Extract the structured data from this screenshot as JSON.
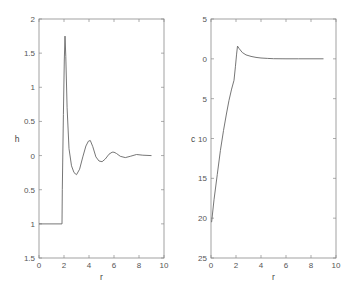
{
  "chart_data": [
    {
      "type": "line",
      "title": "",
      "xlabel": "r",
      "ylabel": "h",
      "xlim": [
        0,
        10
      ],
      "ylim": [
        -1.5,
        2
      ],
      "grid": false,
      "x_ticks": [
        0,
        2,
        4,
        6,
        8,
        10
      ],
      "x_tick_labels": [
        "0",
        "2",
        "4",
        "6",
        "8",
        "10"
      ],
      "y_ticks": [
        2,
        1.5,
        1,
        0.5,
        0,
        -0.5,
        -1,
        -1.5
      ],
      "y_tick_labels": [
        "2",
        "1.5",
        "1",
        "0.5",
        "0",
        "0.5",
        "1",
        "1.5"
      ],
      "series": [
        {
          "name": "h(r)",
          "x": [
            0,
            1.84,
            1.86,
            1.95,
            2.02,
            2.08,
            2.14,
            2.25,
            2.4,
            2.6,
            2.8,
            3.0,
            3.25,
            3.5,
            3.75,
            3.95,
            4.1,
            4.3,
            4.55,
            4.8,
            5.05,
            5.3,
            5.6,
            5.85,
            6.0,
            6.2,
            6.5,
            6.9,
            7.3,
            7.8,
            8.3,
            9.0
          ],
          "values": [
            -1,
            -1,
            -0.5,
            0.6,
            1.4,
            1.75,
            1.45,
            0.7,
            0.1,
            -0.15,
            -0.25,
            -0.28,
            -0.2,
            -0.02,
            0.14,
            0.21,
            0.22,
            0.13,
            -0.02,
            -0.08,
            -0.09,
            -0.05,
            0.02,
            0.05,
            0.05,
            0.03,
            -0.01,
            -0.03,
            -0.01,
            0.015,
            0.005,
            0.0
          ]
        }
      ]
    },
    {
      "type": "line",
      "title": "",
      "xlabel": "r",
      "ylabel": "c",
      "xlim": [
        0,
        10
      ],
      "ylim": [
        -25,
        5
      ],
      "grid": false,
      "x_ticks": [
        0,
        2,
        4,
        6,
        8,
        10
      ],
      "x_tick_labels": [
        "0",
        "2",
        "4",
        "6",
        "8",
        "10"
      ],
      "y_ticks": [
        5,
        0,
        -5,
        -10,
        -15,
        -20,
        -25
      ],
      "y_tick_labels": [
        "5",
        "0",
        "5",
        "10",
        "15",
        "20",
        "25"
      ],
      "series": [
        {
          "name": "c(r)",
          "x": [
            0.05,
            0.24,
            0.5,
            0.75,
            1.0,
            1.25,
            1.44,
            1.65,
            1.84,
            1.95,
            2.05,
            2.12,
            2.25,
            2.5,
            2.8,
            3.2,
            3.6,
            4.0,
            4.5,
            5.0,
            6.0,
            7.0,
            8.0,
            9.0
          ],
          "values": [
            -20.5,
            -17.7,
            -14.5,
            -11.5,
            -9.0,
            -6.8,
            -5.2,
            -3.8,
            -2.7,
            -1.0,
            0.6,
            1.6,
            1.3,
            0.8,
            0.5,
            0.3,
            0.18,
            0.1,
            0.05,
            0.02,
            0.0,
            0.0,
            0.0,
            0.0
          ]
        }
      ]
    }
  ]
}
